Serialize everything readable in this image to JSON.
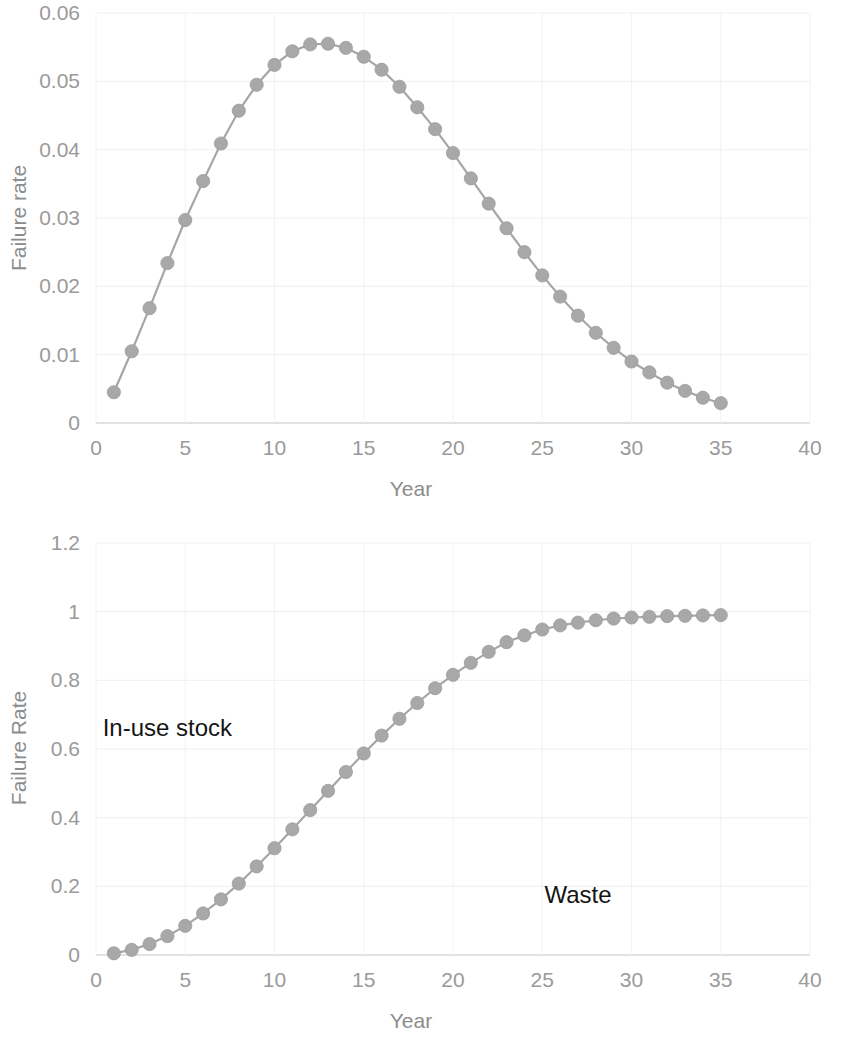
{
  "figure": {
    "background_color": "#ffffff",
    "series_color": "#a6a6a6",
    "axis_text_color": "#9a9a9a",
    "label_text_color": "#141414"
  },
  "charts": [
    {
      "id": "failure-rate-pdf",
      "type": "line",
      "title": "",
      "xlabel": "Year",
      "ylabel": "Failure rate",
      "xlim": [
        0,
        40
      ],
      "ylim": [
        0,
        0.06
      ],
      "xticks": [
        "0",
        "5",
        "10",
        "15",
        "20",
        "25",
        "30",
        "35",
        "40"
      ],
      "xtick_values": [
        0,
        5,
        10,
        15,
        20,
        25,
        30,
        35,
        40
      ],
      "yticks": [
        "0",
        "0.01",
        "0.02",
        "0.03",
        "0.04",
        "0.05",
        "0.06"
      ],
      "ytick_values": [
        0,
        0.01,
        0.02,
        0.03,
        0.04,
        0.05,
        0.06
      ],
      "grid": true,
      "legend": "none",
      "markers": true,
      "x": [
        1,
        2,
        3,
        4,
        5,
        6,
        7,
        8,
        9,
        10,
        11,
        12,
        13,
        14,
        15,
        16,
        17,
        18,
        19,
        20,
        21,
        22,
        23,
        24,
        25,
        26,
        27,
        28,
        29,
        30,
        31,
        32,
        33,
        34,
        35
      ],
      "values": [
        0.0045,
        0.0105,
        0.0168,
        0.0234,
        0.0297,
        0.0354,
        0.0409,
        0.0457,
        0.0495,
        0.0524,
        0.0544,
        0.0554,
        0.0555,
        0.0549,
        0.0536,
        0.0517,
        0.0492,
        0.0462,
        0.043,
        0.0395,
        0.0358,
        0.0321,
        0.0285,
        0.025,
        0.0216,
        0.0185,
        0.0157,
        0.0132,
        0.011,
        0.009,
        0.0074,
        0.0059,
        0.0047,
        0.0037,
        0.0029
      ]
    },
    {
      "id": "cumulative-failure-rate",
      "type": "line",
      "title": "",
      "xlabel": "Year",
      "ylabel": "Failure Rate",
      "xlim": [
        0,
        40
      ],
      "ylim": [
        0,
        1.2
      ],
      "xticks": [
        "0",
        "5",
        "10",
        "15",
        "20",
        "25",
        "30",
        "35",
        "40"
      ],
      "xtick_values": [
        0,
        5,
        10,
        15,
        20,
        25,
        30,
        35,
        40
      ],
      "yticks": [
        "0",
        "0.2",
        "0.4",
        "0.6",
        "0.8",
        "1",
        "1.2"
      ],
      "ytick_values": [
        0,
        0.2,
        0.4,
        0.6,
        0.8,
        1.0,
        1.2
      ],
      "grid": true,
      "legend": "none",
      "markers": true,
      "annotations": [
        {
          "text": "In-use stock",
          "x_year": 4.0,
          "y_value": 0.66
        },
        {
          "text": "Waste",
          "x_year": 27.0,
          "y_value": 0.175
        }
      ],
      "x": [
        1,
        2,
        3,
        4,
        5,
        6,
        7,
        8,
        9,
        10,
        11,
        12,
        13,
        14,
        15,
        16,
        17,
        18,
        19,
        20,
        21,
        22,
        23,
        24,
        25,
        26,
        27,
        28,
        29,
        30,
        31,
        32,
        33,
        34,
        35
      ],
      "values": [
        0.005,
        0.015,
        0.032,
        0.055,
        0.085,
        0.121,
        0.162,
        0.208,
        0.258,
        0.311,
        0.366,
        0.422,
        0.478,
        0.533,
        0.587,
        0.639,
        0.688,
        0.734,
        0.777,
        0.816,
        0.851,
        0.883,
        0.911,
        0.931,
        0.948,
        0.96,
        0.968,
        0.975,
        0.98,
        0.983,
        0.985,
        0.987,
        0.988,
        0.989,
        0.99
      ]
    }
  ]
}
